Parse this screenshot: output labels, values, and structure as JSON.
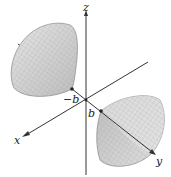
{
  "diagram": {
    "type": "3d-surface",
    "axes": {
      "x_label": "x",
      "y_label": "y",
      "z_label": "z"
    },
    "points": {
      "neg_vertex_label": "−b",
      "pos_vertex_label": "b"
    },
    "colors": {
      "surface": "#cfcfcf",
      "surface_dark": "#a9a9a9",
      "mesh": "#9a9a9a",
      "axis": "#333333"
    }
  }
}
